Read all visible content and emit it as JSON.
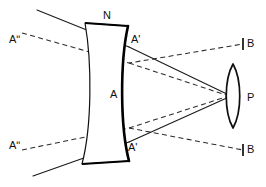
{
  "figure": {
    "type": "optics-ray-diagram",
    "background_color": "#ffffff",
    "line_color": "#111111",
    "width": 266,
    "height": 187
  },
  "labels": {
    "lens_top": "N",
    "lens_right_top": "A'",
    "lens_center": "A",
    "lens_right_bottom": "A'",
    "source_top_left": "Aʺ",
    "source_bottom_left": "Aʺ",
    "image_top_right": "B",
    "image_bottom_right": "B",
    "converging_lens": "P"
  },
  "elements": {
    "concave_lens": {
      "name": "biconcave-lens",
      "label": "N",
      "top_edge": {
        "x1": 85,
        "y1": 23,
        "x2": 128,
        "y2": 26
      },
      "bottom_edge": {
        "x1": 82,
        "y1": 164,
        "x2": 129,
        "y2": 161
      }
    },
    "convex_lens": {
      "name": "converging-lens",
      "label": "P",
      "center_x": 233,
      "center_y": 96,
      "half_height": 32,
      "half_width": 9
    },
    "focal_point": {
      "x": 229,
      "y": 96
    }
  },
  "rays": {
    "solid": [
      {
        "name": "upper-incident-ray",
        "points": "37,10 129,47 229,96"
      },
      {
        "name": "lower-incident-ray",
        "points": "33,176 129,142 229,96"
      },
      {
        "name": "upper-refracted-ray",
        "points": "129,47 229,95"
      },
      {
        "name": "lower-refracted-ray",
        "points": "129,142 229,97"
      }
    ],
    "dashed": [
      {
        "name": "upper-virtual-object-ray",
        "points": "22,33 129,63 243,44"
      },
      {
        "name": "lower-virtual-object-ray",
        "points": "22,150 129,128 243,150"
      },
      {
        "name": "upper-axis-extension",
        "points": "129,63 229,96"
      },
      {
        "name": "lower-axis-extension",
        "points": "129,128 229,96"
      }
    ]
  },
  "ticks": [
    {
      "name": "upper-image-tick",
      "x": 243,
      "y1": 38,
      "y2": 50
    },
    {
      "name": "lower-image-tick",
      "x": 243,
      "y1": 144,
      "y2": 156
    }
  ]
}
